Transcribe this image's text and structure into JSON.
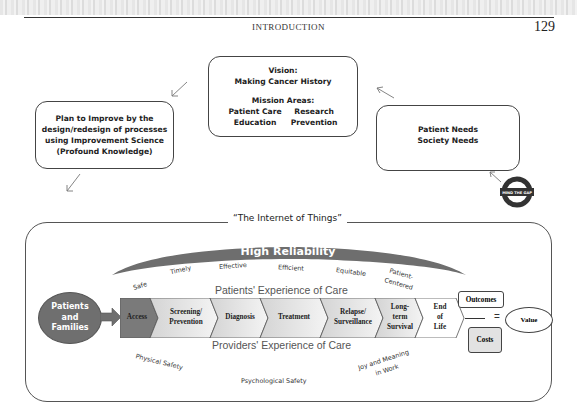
{
  "page": {
    "running_head": "INTRODUCTION",
    "page_number": "129"
  },
  "vision_box": {
    "vision_label": "Vision:",
    "vision_text": "Making Cancer History",
    "mission_label": "Mission Areas:",
    "mission_areas": [
      "Patient Care",
      "Research",
      "Education",
      "Prevention"
    ]
  },
  "plan_box": {
    "lines": [
      "Plan to Improve by the",
      "design/redesign of processes",
      "using Improvement Science",
      "(Profound Knowledge)"
    ]
  },
  "needs_box": {
    "lines": [
      "Patient Needs",
      "Society Needs"
    ]
  },
  "mind_the_gap": {
    "label": "MIND THE GAP"
  },
  "iot": {
    "title": "“The Internet of Things”",
    "high_reliability": "High Reliability",
    "quality_dimensions": [
      "Safe",
      "Timely",
      "Effective",
      "Efficient",
      "Equitable",
      "Patient-",
      "Centered"
    ],
    "patients_experience": "Patients' Experience of Care",
    "providers_experience": "Providers' Experience of Care",
    "patients_families": [
      "Patients",
      "and",
      "Families"
    ],
    "care_continuum": [
      {
        "lines": [
          "Access"
        ]
      },
      {
        "lines": [
          "Screening/",
          "Prevention"
        ]
      },
      {
        "lines": [
          "Diagnosis"
        ]
      },
      {
        "lines": [
          "Treatment"
        ]
      },
      {
        "lines": [
          "Relapse/",
          "Surveillance"
        ]
      },
      {
        "lines": [
          "Long-",
          "term",
          "Survival"
        ]
      },
      {
        "lines": [
          "End",
          "of",
          "Life"
        ]
      }
    ],
    "value_equation": {
      "numerator": "Outcomes",
      "denominator": "Costs",
      "equals": "=",
      "result": "Value"
    },
    "provider_dimensions": [
      "Physical Safety",
      "Psychological Safety",
      "Joy and Meaning",
      "in Work"
    ]
  },
  "colors": {
    "arc": "#6e6e6e",
    "access": "#7a7a7a",
    "chevron_light": "#e0e0e0",
    "patients_bubble": "#6f6f6f",
    "costs_fill": "#e2e2e2"
  }
}
